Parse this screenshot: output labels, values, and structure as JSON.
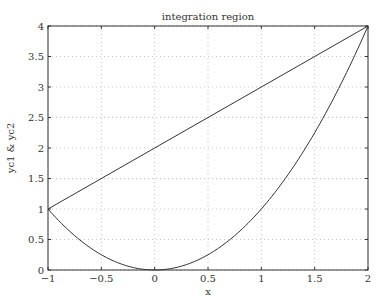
{
  "chart_data": {
    "type": "line",
    "title": "integration region",
    "xlabel": "x",
    "ylabel": "yc1 & yc2",
    "xlim": [
      -1,
      2
    ],
    "ylim": [
      0,
      4
    ],
    "xticks": [
      -1,
      -0.5,
      0,
      0.5,
      1,
      1.5,
      2
    ],
    "xtick_labels": [
      "−1",
      "−0.5",
      "0",
      "0.5",
      "1",
      "1.5",
      "2"
    ],
    "yticks": [
      0,
      0.5,
      1,
      1.5,
      2,
      2.5,
      3,
      3.5,
      4
    ],
    "ytick_labels": [
      "0",
      "0.5",
      "1",
      "1.5",
      "2",
      "2.5",
      "3",
      "3.5",
      "4"
    ],
    "grid": true,
    "legend": null,
    "series": [
      {
        "name": "yc1",
        "expression": "x + 2",
        "x": [
          -1,
          2
        ],
        "values": [
          1,
          4
        ],
        "color": "#333333"
      },
      {
        "name": "yc2",
        "expression": "x^2",
        "x": [
          -1,
          -0.75,
          -0.5,
          -0.25,
          0,
          0.25,
          0.5,
          0.75,
          1,
          1.25,
          1.5,
          1.75,
          2
        ],
        "values": [
          1,
          0.5625,
          0.25,
          0.0625,
          0,
          0.0625,
          0.25,
          0.5625,
          1,
          1.5625,
          2.25,
          3.0625,
          4
        ],
        "color": "#333333"
      }
    ]
  },
  "layout": {
    "plot": {
      "left": 48,
      "right": 368,
      "top": 26,
      "bottom": 270
    },
    "grid_color": "#c8c8c8",
    "axis_color": "#333333"
  }
}
